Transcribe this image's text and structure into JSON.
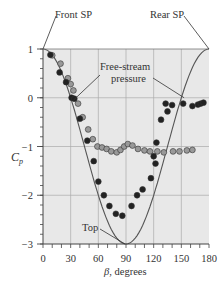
{
  "chart_data": {
    "type": "scatter",
    "title": "",
    "xlabel": "β, degrees",
    "ylabel": "C_p",
    "xlim": [
      0,
      180
    ],
    "ylim": [
      -3,
      1
    ],
    "xticks": [
      0,
      30,
      60,
      90,
      120,
      150,
      180
    ],
    "yticks": [
      1,
      0,
      -1,
      -2,
      -3
    ],
    "grid": true,
    "background": "#e8e8e8",
    "annotations": [
      {
        "text": "Front SP",
        "x": 0,
        "y": 1
      },
      {
        "text": "Rear SP",
        "x": 180,
        "y": 1
      },
      {
        "text": "Free-stream pressure",
        "targets": [
          [
            30,
            0
          ],
          [
            150,
            0
          ]
        ]
      },
      {
        "text": "Top",
        "x": 90,
        "y": -3
      }
    ],
    "series": [
      {
        "name": "Inviscid theory (1 - 4 sin^2 β)",
        "kind": "line",
        "color": "#555555",
        "x": [
          0,
          10,
          20,
          30,
          40,
          50,
          60,
          70,
          80,
          90,
          100,
          110,
          120,
          130,
          140,
          150,
          160,
          170,
          180
        ],
        "values": [
          1.0,
          0.88,
          0.53,
          0.0,
          -0.65,
          -1.35,
          -2.0,
          -2.53,
          -2.88,
          -3.0,
          -2.88,
          -2.53,
          -2.0,
          -1.35,
          -0.65,
          0.0,
          0.53,
          0.88,
          1.0
        ]
      },
      {
        "name": "Data (dark)",
        "kind": "scatter",
        "color": "#222222",
        "x": [
          8,
          18,
          25,
          31,
          34,
          40,
          48,
          55,
          60,
          66,
          72,
          79,
          86,
          96,
          102,
          108,
          117,
          120,
          122,
          123,
          128,
          133,
          135,
          140,
          152,
          162,
          168,
          171,
          174
        ],
        "values": [
          0.88,
          0.52,
          0.32,
          0.0,
          -0.02,
          -0.43,
          -0.88,
          -1.3,
          -1.72,
          -2.0,
          -2.22,
          -2.38,
          -2.42,
          -2.22,
          -2.0,
          -1.88,
          -1.65,
          -1.2,
          -1.35,
          -0.92,
          -0.45,
          -0.12,
          -0.28,
          -0.15,
          -0.12,
          -0.17,
          -0.14,
          -0.12,
          -0.1
        ]
      },
      {
        "name": "Data (light)",
        "kind": "scatter",
        "color": "#999999",
        "x": [
          10,
          19,
          27,
          30,
          33,
          38,
          43,
          49,
          54,
          59,
          64,
          69,
          74,
          80,
          84,
          88,
          92,
          97,
          103,
          110,
          116,
          124,
          131,
          141,
          148,
          156,
          162
        ],
        "values": [
          0.87,
          0.7,
          0.4,
          0.28,
          0.15,
          -0.12,
          -0.4,
          -0.65,
          -0.85,
          -1.0,
          -1.02,
          -1.05,
          -1.1,
          -1.12,
          -1.07,
          -1.0,
          -0.95,
          -0.98,
          -1.05,
          -1.08,
          -1.1,
          -1.1,
          -1.12,
          -1.1,
          -1.1,
          -1.08,
          -1.07
        ]
      }
    ]
  },
  "labels": {
    "front_sp": "Front SP",
    "rear_sp": "Rear SP",
    "free_stream_1": "Free-stream",
    "free_stream_2": "pressure",
    "top": "Top",
    "ylabel_main": "C",
    "ylabel_sub": "p",
    "xlabel_beta": "β",
    "xlabel_rest": ", degrees"
  }
}
